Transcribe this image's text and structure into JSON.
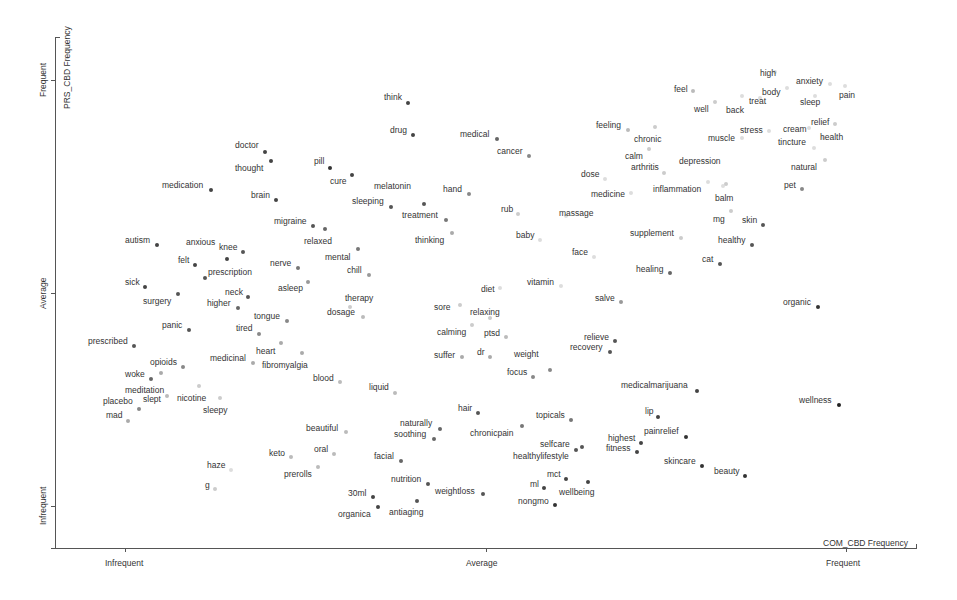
{
  "chart_data": {
    "type": "scatter",
    "title": "",
    "xlabel": "COM_CBD Frequency",
    "ylabel": "PRS_CBD Frequency",
    "x_ticks": [
      "Infrequent",
      "Average",
      "Frequent"
    ],
    "y_ticks": [
      "Infrequent",
      "Average",
      "Frequent"
    ],
    "xlim": [
      0,
      1
    ],
    "ylim": [
      0,
      1
    ],
    "grid": false,
    "legend": null,
    "points": [
      {
        "term": "think",
        "px": 408,
        "py": 103,
        "lx": 384,
        "ly": 93,
        "c": "#444"
      },
      {
        "term": "drug",
        "px": 413,
        "py": 135,
        "lx": 390,
        "ly": 126,
        "c": "#444"
      },
      {
        "term": "medical",
        "px": 497,
        "py": 139,
        "lx": 460,
        "ly": 130,
        "c": "#666"
      },
      {
        "term": "cancer",
        "px": 529,
        "py": 156,
        "lx": 497,
        "ly": 147,
        "c": "#888"
      },
      {
        "term": "doctor",
        "px": 265,
        "py": 152,
        "lx": 235,
        "ly": 141,
        "c": "#444"
      },
      {
        "term": "thought",
        "px": 271,
        "py": 161,
        "lx": 235,
        "ly": 164,
        "c": "#444"
      },
      {
        "term": "medication",
        "px": 211,
        "py": 190,
        "lx": 162,
        "ly": 181,
        "c": "#444"
      },
      {
        "term": "brain",
        "px": 276,
        "py": 200,
        "lx": 251,
        "ly": 191,
        "c": "#444"
      },
      {
        "term": "pill",
        "px": 330,
        "py": 168,
        "lx": 314,
        "ly": 157,
        "c": "#333"
      },
      {
        "term": "cure",
        "px": 352,
        "py": 175,
        "lx": 330,
        "ly": 177,
        "c": "#444"
      },
      {
        "term": "melatonin",
        "px": 424,
        "py": 204,
        "lx": 374,
        "ly": 182,
        "c": "#555"
      },
      {
        "term": "sleeping",
        "px": 391,
        "py": 207,
        "lx": 352,
        "ly": 197,
        "c": "#555"
      },
      {
        "term": "hand",
        "px": 469,
        "py": 194,
        "lx": 443,
        "ly": 185,
        "c": "#888"
      },
      {
        "term": "treatment",
        "px": 446,
        "py": 220,
        "lx": 402,
        "ly": 211,
        "c": "#777"
      },
      {
        "term": "thinking",
        "px": 452,
        "py": 233,
        "lx": 415,
        "ly": 236,
        "c": "#aaa"
      },
      {
        "term": "migraine",
        "px": 313,
        "py": 226,
        "lx": 274,
        "ly": 217,
        "c": "#555"
      },
      {
        "term": "relaxed",
        "px": 325,
        "py": 229,
        "lx": 304,
        "ly": 237,
        "c": "#666"
      },
      {
        "term": "mental",
        "px": 358,
        "py": 249,
        "lx": 325,
        "ly": 253,
        "c": "#777"
      },
      {
        "term": "chill",
        "px": 369,
        "py": 275,
        "lx": 347,
        "ly": 266,
        "c": "#999"
      },
      {
        "term": "autism",
        "px": 157,
        "py": 245,
        "lx": 125,
        "ly": 236,
        "c": "#444"
      },
      {
        "term": "anxious",
        "px": 227,
        "py": 259,
        "lx": 186,
        "ly": 238,
        "c": "#444"
      },
      {
        "term": "knee",
        "px": 243,
        "py": 252,
        "lx": 219,
        "ly": 243,
        "c": "#555"
      },
      {
        "term": "felt",
        "px": 195,
        "py": 265,
        "lx": 178,
        "ly": 256,
        "c": "#444"
      },
      {
        "term": "prescription",
        "px": 205,
        "py": 278,
        "lx": 208,
        "ly": 268,
        "c": "#555"
      },
      {
        "term": "nerve",
        "px": 298,
        "py": 268,
        "lx": 270,
        "ly": 259,
        "c": "#777"
      },
      {
        "term": "asleep",
        "px": 308,
        "py": 282,
        "lx": 278,
        "ly": 284,
        "c": "#999"
      },
      {
        "term": "sick",
        "px": 145,
        "py": 287,
        "lx": 125,
        "ly": 278,
        "c": "#444"
      },
      {
        "term": "surgery",
        "px": 178,
        "py": 294,
        "lx": 143,
        "ly": 297,
        "c": "#555"
      },
      {
        "term": "neck",
        "px": 248,
        "py": 297,
        "lx": 225,
        "ly": 288,
        "c": "#555"
      },
      {
        "term": "higher",
        "px": 238,
        "py": 308,
        "lx": 207,
        "ly": 299,
        "c": "#666"
      },
      {
        "term": "tongue",
        "px": 287,
        "py": 321,
        "lx": 254,
        "ly": 312,
        "c": "#888"
      },
      {
        "term": "tired",
        "px": 259,
        "py": 334,
        "lx": 236,
        "ly": 324,
        "c": "#888"
      },
      {
        "term": "panic",
        "px": 189,
        "py": 330,
        "lx": 162,
        "ly": 321,
        "c": "#555"
      },
      {
        "term": "prescribed",
        "px": 134,
        "py": 346,
        "lx": 88,
        "ly": 337,
        "c": "#555"
      },
      {
        "term": "heart",
        "px": 281,
        "py": 343,
        "lx": 256,
        "ly": 347,
        "c": "#aaa"
      },
      {
        "term": "medicinal",
        "px": 253,
        "py": 363,
        "lx": 210,
        "ly": 354,
        "c": "#aaa"
      },
      {
        "term": "fibromyalgia",
        "px": 302,
        "py": 353,
        "lx": 262,
        "ly": 361,
        "c": "#aaa"
      },
      {
        "term": "blood",
        "px": 340,
        "py": 382,
        "lx": 313,
        "ly": 374,
        "c": "#bbb"
      },
      {
        "term": "opioids",
        "px": 183,
        "py": 367,
        "lx": 150,
        "ly": 358,
        "c": "#888"
      },
      {
        "term": "woke",
        "px": 151,
        "py": 379,
        "lx": 125,
        "ly": 370,
        "c": "#666"
      },
      {
        "term": "meditation",
        "px": 161,
        "py": 373,
        "lx": 125,
        "ly": 386,
        "c": "#aaa"
      },
      {
        "term": "slept",
        "px": 167,
        "py": 396,
        "lx": 143,
        "ly": 395,
        "c": "#bbb"
      },
      {
        "term": "nicotine",
        "px": 199,
        "py": 386,
        "lx": 177,
        "ly": 394,
        "c": "#ccc"
      },
      {
        "term": "placebo",
        "px": 139,
        "py": 409,
        "lx": 103,
        "ly": 397,
        "c": "#888"
      },
      {
        "term": "mad",
        "px": 128,
        "py": 421,
        "lx": 106,
        "ly": 411,
        "c": "#aaa"
      },
      {
        "term": "sleepy",
        "px": 220,
        "py": 398,
        "lx": 203,
        "ly": 406,
        "c": "#ccc"
      },
      {
        "term": "therapy",
        "px": 350,
        "py": 307,
        "lx": 345,
        "ly": 294,
        "c": "#ccc"
      },
      {
        "term": "dosage",
        "px": 363,
        "py": 317,
        "lx": 327,
        "ly": 308,
        "c": "#bbb"
      },
      {
        "term": "liquid",
        "px": 395,
        "py": 393,
        "lx": 369,
        "ly": 383,
        "c": "#bbb"
      },
      {
        "term": "beautiful",
        "px": 346,
        "py": 432,
        "lx": 306,
        "ly": 424,
        "c": "#bbb"
      },
      {
        "term": "keto",
        "px": 291,
        "py": 457,
        "lx": 269,
        "ly": 449,
        "c": "#bbb"
      },
      {
        "term": "oral",
        "px": 334,
        "py": 454,
        "lx": 314,
        "ly": 445,
        "c": "#bbb"
      },
      {
        "term": "haze",
        "px": 231,
        "py": 470,
        "lx": 207,
        "ly": 461,
        "c": "#ddd"
      },
      {
        "term": "prerolls",
        "px": 318,
        "py": 467,
        "lx": 284,
        "ly": 470,
        "c": "#bbb"
      },
      {
        "term": "g",
        "px": 215,
        "py": 489,
        "lx": 205,
        "ly": 481,
        "c": "#ccc"
      },
      {
        "term": "facial",
        "px": 401,
        "py": 461,
        "lx": 374,
        "ly": 452,
        "c": "#666"
      },
      {
        "term": "naturally",
        "px": 440,
        "py": 429,
        "lx": 400,
        "ly": 419,
        "c": "#666"
      },
      {
        "term": "soothing",
        "px": 434,
        "py": 439,
        "lx": 394,
        "ly": 430,
        "c": "#666"
      },
      {
        "term": "nutrition",
        "px": 428,
        "py": 484,
        "lx": 391,
        "ly": 475,
        "c": "#555"
      },
      {
        "term": "weightloss",
        "px": 483,
        "py": 494,
        "lx": 435,
        "ly": 487,
        "c": "#555"
      },
      {
        "term": "30ml",
        "px": 373,
        "py": 497,
        "lx": 348,
        "ly": 489,
        "c": "#444"
      },
      {
        "term": "organica",
        "px": 378,
        "py": 507,
        "lx": 338,
        "ly": 510,
        "c": "#444"
      },
      {
        "term": "antiaging",
        "px": 417,
        "py": 501,
        "lx": 389,
        "ly": 508,
        "c": "#555"
      },
      {
        "term": "hair",
        "px": 478,
        "py": 413,
        "lx": 458,
        "ly": 404,
        "c": "#555"
      },
      {
        "term": "chronicpain",
        "px": 522,
        "py": 426,
        "lx": 470,
        "ly": 429,
        "c": "#777"
      },
      {
        "term": "topicals",
        "px": 571,
        "py": 420,
        "lx": 536,
        "ly": 411,
        "c": "#777"
      },
      {
        "term": "selfcare",
        "px": 576,
        "py": 450,
        "lx": 540,
        "ly": 440,
        "c": "#555"
      },
      {
        "term": "healthylifestyle",
        "px": 582,
        "py": 447,
        "lx": 513,
        "ly": 452,
        "c": "#555"
      },
      {
        "term": "mct",
        "px": 566,
        "py": 479,
        "lx": 547,
        "ly": 470,
        "c": "#444"
      },
      {
        "term": "ml",
        "px": 544,
        "py": 488,
        "lx": 530,
        "ly": 480,
        "c": "#444"
      },
      {
        "term": "wellbeing",
        "px": 588,
        "py": 482,
        "lx": 559,
        "ly": 488,
        "c": "#444"
      },
      {
        "term": "nongmo",
        "px": 555,
        "py": 505,
        "lx": 518,
        "ly": 497,
        "c": "#333"
      },
      {
        "term": "sore",
        "px": 460,
        "py": 305,
        "lx": 434,
        "ly": 303,
        "c": "#ccc"
      },
      {
        "term": "diet",
        "px": 500,
        "py": 288,
        "lx": 481,
        "ly": 285,
        "c": "#ddd"
      },
      {
        "term": "relaxing",
        "px": 490,
        "py": 318,
        "lx": 470,
        "ly": 308,
        "c": "#ccc"
      },
      {
        "term": "calming",
        "px": 472,
        "py": 325,
        "lx": 437,
        "ly": 328,
        "c": "#ccc"
      },
      {
        "term": "ptsd",
        "px": 506,
        "py": 337,
        "lx": 484,
        "ly": 329,
        "c": "#bbb"
      },
      {
        "term": "suffer",
        "px": 462,
        "py": 357,
        "lx": 434,
        "ly": 351,
        "c": "#aaa"
      },
      {
        "term": "dr",
        "px": 490,
        "py": 357,
        "lx": 477,
        "ly": 348,
        "c": "#aaa"
      },
      {
        "term": "weight",
        "px": 550,
        "py": 370,
        "lx": 514,
        "ly": 350,
        "c": "#888"
      },
      {
        "term": "focus",
        "px": 533,
        "py": 377,
        "lx": 507,
        "ly": 368,
        "c": "#888"
      },
      {
        "term": "vitamin",
        "px": 561,
        "py": 286,
        "lx": 527,
        "ly": 278,
        "c": "#ddd"
      },
      {
        "term": "face",
        "px": 594,
        "py": 257,
        "lx": 572,
        "ly": 248,
        "c": "#ddd"
      },
      {
        "term": "salve",
        "px": 621,
        "py": 302,
        "lx": 595,
        "ly": 294,
        "c": "#999"
      },
      {
        "term": "relieve",
        "px": 615,
        "py": 341,
        "lx": 584,
        "ly": 333,
        "c": "#555"
      },
      {
        "term": "recovery",
        "px": 610,
        "py": 352,
        "lx": 570,
        "ly": 343,
        "c": "#555"
      },
      {
        "term": "medicalmarijuana",
        "px": 697,
        "py": 391,
        "lx": 621,
        "ly": 381,
        "c": "#444"
      },
      {
        "term": "lip",
        "px": 658,
        "py": 417,
        "lx": 645,
        "ly": 407,
        "c": "#444"
      },
      {
        "term": "highest",
        "px": 641,
        "py": 443,
        "lx": 608,
        "ly": 434,
        "c": "#444"
      },
      {
        "term": "fitness",
        "px": 637,
        "py": 452,
        "lx": 606,
        "ly": 444,
        "c": "#444"
      },
      {
        "term": "painrelief",
        "px": 686,
        "py": 437,
        "lx": 644,
        "ly": 427,
        "c": "#333"
      },
      {
        "term": "skincare",
        "px": 702,
        "py": 466,
        "lx": 664,
        "ly": 457,
        "c": "#333"
      },
      {
        "term": "beauty",
        "px": 745,
        "py": 476,
        "lx": 714,
        "ly": 467,
        "c": "#333"
      },
      {
        "term": "organic",
        "px": 818,
        "py": 307,
        "lx": 783,
        "ly": 298,
        "c": "#333"
      },
      {
        "term": "wellness",
        "px": 839,
        "py": 405,
        "lx": 799,
        "ly": 396,
        "c": "#222"
      },
      {
        "term": "rub",
        "px": 518,
        "py": 214,
        "lx": 501,
        "ly": 205,
        "c": "#ccc"
      },
      {
        "term": "baby",
        "px": 540,
        "py": 240,
        "lx": 516,
        "ly": 231,
        "c": "#ddd"
      },
      {
        "term": "massage",
        "px": 566,
        "py": 216,
        "lx": 559,
        "ly": 209,
        "c": "#ddd"
      },
      {
        "term": "dose",
        "px": 605,
        "py": 179,
        "lx": 581,
        "ly": 170,
        "c": "#ddd"
      },
      {
        "term": "medicine",
        "px": 631,
        "py": 193,
        "lx": 591,
        "ly": 190,
        "c": "#ddd"
      },
      {
        "term": "feeling",
        "px": 628,
        "py": 130,
        "lx": 596,
        "ly": 121,
        "c": "#bbb"
      },
      {
        "term": "chronic",
        "px": 655,
        "py": 127,
        "lx": 634,
        "ly": 135,
        "c": "#ccc"
      },
      {
        "term": "calm",
        "px": 649,
        "py": 149,
        "lx": 625,
        "ly": 152,
        "c": "#ccc"
      },
      {
        "term": "arthritis",
        "px": 664,
        "py": 173,
        "lx": 631,
        "ly": 163,
        "c": "#ccc"
      },
      {
        "term": "depression",
        "px": 708,
        "py": 182,
        "lx": 679,
        "ly": 157,
        "c": "#ddd"
      },
      {
        "term": "inflammation",
        "px": 723,
        "py": 186,
        "lx": 653,
        "ly": 185,
        "c": "#ddd"
      },
      {
        "term": "balm",
        "px": 726,
        "py": 184,
        "lx": 715,
        "ly": 194,
        "c": "#ccc"
      },
      {
        "term": "mg",
        "px": 731,
        "py": 211,
        "lx": 713,
        "ly": 215,
        "c": "#ccc"
      },
      {
        "term": "skin",
        "px": 763,
        "py": 225,
        "lx": 742,
        "ly": 216,
        "c": "#555"
      },
      {
        "term": "supplement",
        "px": 681,
        "py": 238,
        "lx": 630,
        "ly": 229,
        "c": "#ccc"
      },
      {
        "term": "healthy",
        "px": 752,
        "py": 245,
        "lx": 718,
        "ly": 236,
        "c": "#555"
      },
      {
        "term": "cat",
        "px": 720,
        "py": 264,
        "lx": 702,
        "ly": 255,
        "c": "#555"
      },
      {
        "term": "healing",
        "px": 670,
        "py": 273,
        "lx": 636,
        "ly": 265,
        "c": "#666"
      },
      {
        "term": "feel",
        "px": 693,
        "py": 91,
        "lx": 674,
        "ly": 85,
        "c": "#bbb"
      },
      {
        "term": "well",
        "px": 715,
        "py": 102,
        "lx": 694,
        "ly": 105,
        "c": "#ccc"
      },
      {
        "term": "back",
        "px": 742,
        "py": 96,
        "lx": 726,
        "ly": 106,
        "c": "#ddd"
      },
      {
        "term": "treat",
        "px": 760,
        "py": 98,
        "lx": 749,
        "ly": 97,
        "c": "#ddd"
      },
      {
        "term": "high",
        "px": 775,
        "py": 72,
        "lx": 760,
        "ly": 69,
        "c": "#ddd"
      },
      {
        "term": "body",
        "px": 787,
        "py": 88,
        "lx": 762,
        "ly": 88,
        "c": "#ddd"
      },
      {
        "term": "anxiety",
        "px": 830,
        "py": 84,
        "lx": 796,
        "ly": 77,
        "c": "#ddd"
      },
      {
        "term": "sleep",
        "px": 815,
        "py": 96,
        "lx": 800,
        "ly": 98,
        "c": "#ddd"
      },
      {
        "term": "pain",
        "px": 845,
        "py": 86,
        "lx": 839,
        "ly": 91,
        "c": "#ddd"
      },
      {
        "term": "stress",
        "px": 769,
        "py": 131,
        "lx": 740,
        "ly": 126,
        "c": "#ddd"
      },
      {
        "term": "muscle",
        "px": 742,
        "py": 138,
        "lx": 708,
        "ly": 134,
        "c": "#ddd"
      },
      {
        "term": "cream",
        "px": 809,
        "py": 128,
        "lx": 783,
        "ly": 125,
        "c": "#ddd"
      },
      {
        "term": "relief",
        "px": 835,
        "py": 124,
        "lx": 811,
        "ly": 118,
        "c": "#ccc"
      },
      {
        "term": "tincture",
        "px": 814,
        "py": 148,
        "lx": 778,
        "ly": 138,
        "c": "#ddd"
      },
      {
        "term": "health",
        "px": 823,
        "py": 138,
        "lx": 820,
        "ly": 133,
        "c": "#ddd"
      },
      {
        "term": "natural",
        "px": 825,
        "py": 160,
        "lx": 791,
        "ly": 163,
        "c": "#ccc"
      },
      {
        "term": "pet",
        "px": 802,
        "py": 189,
        "lx": 784,
        "ly": 181,
        "c": "#888"
      }
    ]
  },
  "axes": {
    "x_title": "COM_CBD Frequency",
    "y_title": "PRS_CBD Frequency",
    "x_ticks": [
      {
        "label": "Infrequent",
        "x": 125
      },
      {
        "label": "Average",
        "x": 486
      },
      {
        "label": "Frequent",
        "x": 846
      }
    ],
    "y_ticks": [
      {
        "label": "Frequent",
        "y": 80
      },
      {
        "label": "Average",
        "y": 293
      },
      {
        "label": "Infrequent",
        "y": 506
      }
    ]
  }
}
